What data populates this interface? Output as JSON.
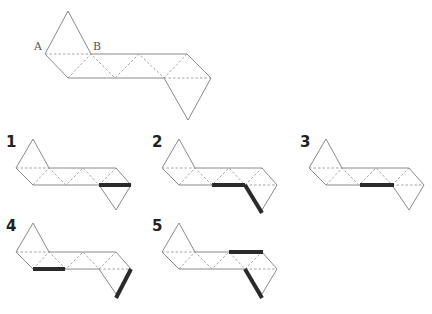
{
  "main_figure": {
    "point_labels": [
      {
        "text": "A",
        "x": 34,
        "y": 50
      },
      {
        "text": "B",
        "x": 93,
        "y": 50
      }
    ]
  },
  "options": [
    {
      "label": "1",
      "lx": 6,
      "ly": 147,
      "ox": -29,
      "oy": 114,
      "s": 1,
      "thick": [
        [
          99,
          185,
          131,
          185
        ]
      ]
    },
    {
      "label": "2",
      "lx": 152,
      "ly": 147,
      "ox": 117,
      "oy": 114,
      "s": 1,
      "thick": [
        [
          212,
          185,
          245,
          185
        ],
        [
          245,
          185,
          262,
          213
        ]
      ]
    },
    {
      "label": "3",
      "lx": 300,
      "ly": 147,
      "ox": 264,
      "oy": 114,
      "s": 1,
      "thick": [
        [
          360,
          185,
          394,
          185
        ]
      ]
    },
    {
      "label": "4",
      "lx": 6,
      "ly": 231,
      "ox": -29,
      "oy": 198,
      "s": 1,
      "thick": [
        [
          33,
          269,
          65,
          269
        ],
        [
          131,
          269,
          116,
          298
        ]
      ]
    },
    {
      "label": "5",
      "lx": 152,
      "ly": 231,
      "ox": 117,
      "oy": 198,
      "s": 1,
      "thick": [
        [
          229,
          252,
          263,
          252
        ],
        [
          245,
          269,
          262,
          298
        ]
      ]
    }
  ],
  "colors": {
    "line": "#8a8a8a",
    "highlight": "#2a2a2a"
  }
}
